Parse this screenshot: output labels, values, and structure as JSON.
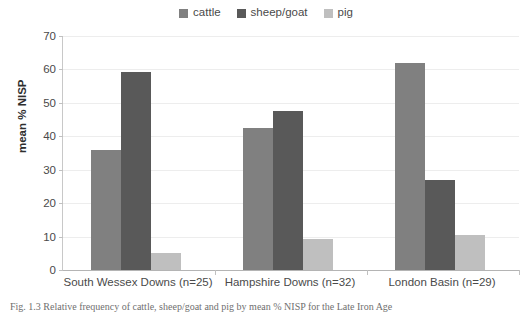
{
  "chart_data": {
    "type": "bar",
    "title": "",
    "subtitle": "",
    "xlabel": "",
    "ylabel": "mean % NISP",
    "ylim": [
      0,
      70
    ],
    "yticks": [
      0,
      10,
      20,
      30,
      40,
      50,
      60,
      70
    ],
    "ytick_labels": [
      "0",
      "10",
      "20",
      "30",
      "40",
      "50",
      "60",
      "70"
    ],
    "grid": true,
    "legend_position": "top-center",
    "categories": [
      "South Wessex Downs (n=25)",
      "Hampshire Downs (n=32)",
      "London Basin (n=29)"
    ],
    "series": [
      {
        "name": "cattle",
        "color": "#808080",
        "values": [
          36.0,
          42.5,
          61.8
        ]
      },
      {
        "name": "sheep/goat",
        "color": "#595959",
        "values": [
          59.1,
          47.6,
          26.9
        ]
      },
      {
        "name": "pig",
        "color": "#bfbfbf",
        "values": [
          5.0,
          9.3,
          10.4
        ]
      }
    ]
  },
  "legend": {
    "items": [
      {
        "label": "cattle",
        "color": "#808080"
      },
      {
        "label": "sheep/goat",
        "color": "#595959"
      },
      {
        "label": "pig",
        "color": "#bfbfbf"
      }
    ]
  },
  "axes": {
    "y_title": "mean % NISP"
  },
  "caption": {
    "text": "Fig. 1.3  Relative frequency of cattle, sheep/goat and pig by mean % NISP for the Late Iron Age"
  }
}
